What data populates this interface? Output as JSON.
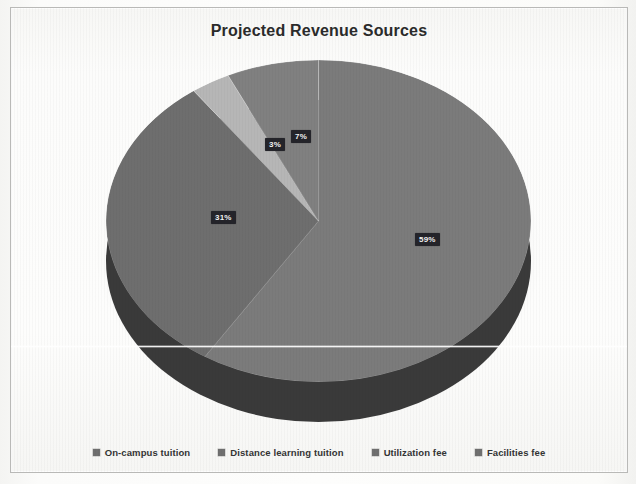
{
  "chart": {
    "title": "Projected Revenue Sources",
    "frame_border_color": "#b9b9b7",
    "background_color": "#fdfdfc"
  },
  "chart_data": {
    "type": "pie",
    "title": "Projected Revenue Sources",
    "xlabel": "",
    "ylabel": "",
    "legend_position": "bottom",
    "grid": false,
    "three_d": true,
    "categories": [
      "On-campus tuition",
      "Distance learning tuition",
      "Utilization fee",
      "Facilities fee"
    ],
    "values": [
      59,
      31,
      3,
      7
    ],
    "labels": [
      "59%",
      "31%",
      "3%",
      "7%"
    ],
    "colors": [
      "#7b7b7b",
      "#6e6e6e",
      "#b6b6b6",
      "#808080"
    ],
    "depth_color": "#3a3a3a",
    "data_label_text_color": "#f2f2f2",
    "data_label_background": "#24242a"
  },
  "slices": [
    {
      "name": "On-campus tuition",
      "label": "59%",
      "value": 59,
      "color": "#7b7b7b",
      "label_x": 404,
      "label_y": 225
    },
    {
      "name": "Distance learning tuition",
      "label": "31%",
      "value": 31,
      "color": "#6e6e6e",
      "label_x": 200,
      "label_y": 203
    },
    {
      "name": "Utilization fee",
      "label": "3%",
      "value": 3,
      "color": "#b6b6b6",
      "label_x": 254,
      "label_y": 130
    },
    {
      "name": "Facilities fee",
      "label": "7%",
      "value": 7,
      "color": "#808080",
      "label_x": 280,
      "label_y": 122
    }
  ],
  "legend": {
    "items": [
      {
        "label": "On-campus tuition",
        "color": "#6f6f6f"
      },
      {
        "label": "Distance learning tuition",
        "color": "#6f6f6f"
      },
      {
        "label": "Utilization fee",
        "color": "#6f6f6f"
      },
      {
        "label": "Facilities fee",
        "color": "#6f6f6f"
      }
    ]
  }
}
